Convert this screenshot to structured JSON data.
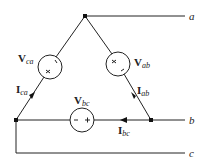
{
  "diagram": {
    "type": "delta-connected three-phase source",
    "terminals": [
      {
        "id": "a",
        "label": "a"
      },
      {
        "id": "b",
        "label": "b"
      },
      {
        "id": "c",
        "label": "c"
      }
    ],
    "sources": [
      {
        "id": "ab",
        "main": "V",
        "sub": "ab",
        "polarity_top": "+",
        "polarity_bottom": "−"
      },
      {
        "id": "bc",
        "main": "V",
        "sub": "bc",
        "polarity_left": "−",
        "polarity_right": "+"
      },
      {
        "id": "ca",
        "main": "V",
        "sub": "ca",
        "polarity_top": "−",
        "polarity_bottom": "+"
      }
    ],
    "currents": [
      {
        "id": "ab",
        "main": "I",
        "sub": "ab"
      },
      {
        "id": "bc",
        "main": "I",
        "sub": "bc"
      },
      {
        "id": "ca",
        "main": "I",
        "sub": "ca"
      }
    ],
    "colors": {
      "line": "#222222",
      "background": "#ffffff"
    }
  }
}
